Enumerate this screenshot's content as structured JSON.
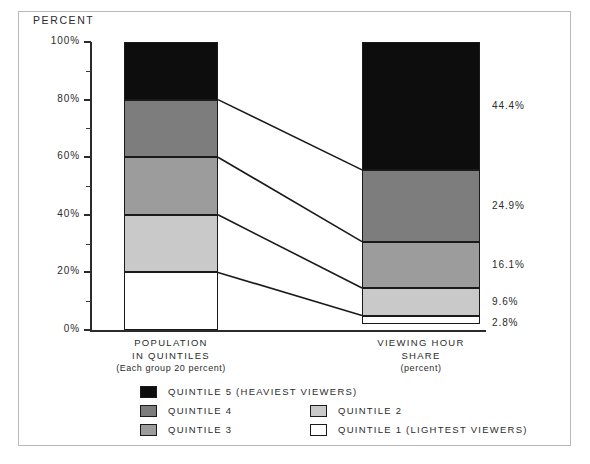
{
  "figure": {
    "y_axis_title": "PERCENT"
  },
  "chart_data": {
    "type": "bar",
    "subtype": "stacked-100-percent",
    "title": "",
    "xlabel": "",
    "ylabel": "PERCENT",
    "ylim": [
      0,
      100
    ],
    "y_ticks_major": [
      "0%",
      "20%",
      "40%",
      "60%",
      "80%",
      "100%"
    ],
    "y_tick_values": [
      0,
      20,
      40,
      60,
      80,
      100
    ],
    "y_minor_tick_values": [
      10,
      30,
      50,
      70,
      90
    ],
    "grid": false,
    "legend_position": "bottom",
    "categories": [
      "POPULATION IN QUINTILES",
      "VIEWING HOUR SHARE"
    ],
    "category_sublabels": [
      "(Each group 20 percent)",
      "(percent)"
    ],
    "series": [
      {
        "name": "QUINTILE 1 (LIGHTEST VIEWERS)",
        "values": [
          20.0,
          2.8
        ],
        "color": "#ffffff"
      },
      {
        "name": "QUINTILE 2",
        "values": [
          20.0,
          9.6
        ],
        "color": "#c9c9c9"
      },
      {
        "name": "QUINTILE 3",
        "values": [
          20.0,
          16.1
        ],
        "color": "#9c9c9c"
      },
      {
        "name": "QUINTILE 4",
        "values": [
          20.0,
          24.9
        ],
        "color": "#7d7d7d"
      },
      {
        "name": "QUINTILE 5 (HEAVIEST VIEWERS)",
        "values": [
          20.0,
          44.4
        ],
        "color": "#0d0d0d"
      }
    ],
    "data_labels_right_bar": [
      "44.4%",
      "24.9%",
      "16.1%",
      "9.6%",
      "2.8%"
    ]
  },
  "y_ticks": [
    {
      "label": "100%",
      "value": 100
    },
    {
      "label": "80%",
      "value": 80
    },
    {
      "label": "60%",
      "value": 60
    },
    {
      "label": "40%",
      "value": 40
    },
    {
      "label": "20%",
      "value": 20
    },
    {
      "label": "0%",
      "value": 0
    }
  ],
  "bars": {
    "left": {
      "name": "population-in-quintiles",
      "label_line1": "POPULATION",
      "label_line2": "IN QUINTILES",
      "label_line3": "(Each group 20 percent)",
      "segments": [
        {
          "name": "QUINTILE 5 (HEAVIEST VIEWERS)",
          "value": 20.0,
          "color": "#0d0d0d"
        },
        {
          "name": "QUINTILE 4",
          "value": 20.0,
          "color": "#7d7d7d"
        },
        {
          "name": "QUINTILE 3",
          "value": 20.0,
          "color": "#9c9c9c"
        },
        {
          "name": "QUINTILE 2",
          "value": 20.0,
          "color": "#c9c9c9"
        },
        {
          "name": "QUINTILE 1 (LIGHTEST VIEWERS)",
          "value": 20.0,
          "color": "#ffffff"
        }
      ]
    },
    "right": {
      "name": "viewing-hour-share",
      "label_line1": "VIEWING HOUR",
      "label_line2": "SHARE",
      "label_line3": "(percent)",
      "segments": [
        {
          "name": "QUINTILE 5 (HEAVIEST VIEWERS)",
          "value": 44.4,
          "label": "44.4%",
          "color": "#0d0d0d"
        },
        {
          "name": "QUINTILE 4",
          "value": 24.9,
          "label": "24.9%",
          "color": "#7d7d7d"
        },
        {
          "name": "QUINTILE 3",
          "value": 16.1,
          "label": "16.1%",
          "color": "#9c9c9c"
        },
        {
          "name": "QUINTILE 2",
          "value": 9.6,
          "label": "9.6%",
          "color": "#c9c9c9"
        },
        {
          "name": "QUINTILE 1 (LIGHTEST VIEWERS)",
          "value": 2.8,
          "label": "2.8%",
          "color": "#ffffff"
        }
      ]
    }
  },
  "legend": {
    "items": [
      {
        "label": "QUINTILE 5 (HEAVIEST VIEWERS)",
        "color": "#0d0d0d",
        "col": 0,
        "row": 0
      },
      {
        "label": "QUINTILE 4",
        "color": "#7d7d7d",
        "col": 0,
        "row": 1
      },
      {
        "label": "QUINTILE 2",
        "color": "#c9c9c9",
        "col": 1,
        "row": 1
      },
      {
        "label": "QUINTILE 3",
        "color": "#9c9c9c",
        "col": 0,
        "row": 2
      },
      {
        "label": "QUINTILE 1 (LIGHTEST VIEWERS)",
        "color": "#ffffff",
        "col": 1,
        "row": 2
      }
    ]
  },
  "colors": {
    "axis": "#2b2b2b",
    "frame": "#b9b9b9",
    "outline": "#1a1a1a",
    "background": "#ffffff"
  }
}
